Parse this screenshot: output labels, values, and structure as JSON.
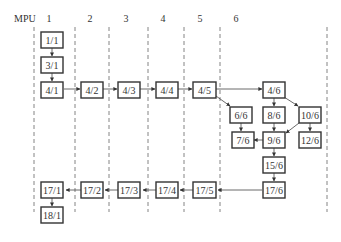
{
  "header": {
    "axis_label": "MPU",
    "columns": [
      "1",
      "2",
      "3",
      "4",
      "5",
      "6"
    ]
  },
  "nodes": {
    "n1_1": "1/1",
    "n3_1": "3/1",
    "n4_1": "4/1",
    "n4_2": "4/2",
    "n4_3": "4/3",
    "n4_4": "4/4",
    "n4_5": "4/5",
    "n4_6": "4/6",
    "n6_6": "6/6",
    "n8_6": "8/6",
    "n10_6": "10/6",
    "n7_6": "7/6",
    "n9_6": "9/6",
    "n12_6": "12/6",
    "n15_6": "15/6",
    "n17_6": "17/6",
    "n17_5": "17/5",
    "n17_4": "17/4",
    "n17_3": "17/3",
    "n17_2": "17/2",
    "n17_1": "17/1",
    "n18_1": "18/1"
  },
  "edges": [
    [
      "1/1",
      "3/1"
    ],
    [
      "3/1",
      "4/1"
    ],
    [
      "4/1",
      "4/2"
    ],
    [
      "4/2",
      "4/3"
    ],
    [
      "4/3",
      "4/4"
    ],
    [
      "4/4",
      "4/5"
    ],
    [
      "4/5",
      "4/6"
    ],
    [
      "4/5",
      "6/6"
    ],
    [
      "4/6",
      "8/6"
    ],
    [
      "4/6",
      "10/6"
    ],
    [
      "6/6",
      "7/6"
    ],
    [
      "8/6",
      "9/6"
    ],
    [
      "10/6",
      "9/6"
    ],
    [
      "10/6",
      "12/6"
    ],
    [
      "9/6",
      "7/6"
    ],
    [
      "9/6",
      "15/6"
    ],
    [
      "15/6",
      "17/6"
    ],
    [
      "17/6",
      "17/5"
    ],
    [
      "17/5",
      "17/4"
    ],
    [
      "17/4",
      "17/3"
    ],
    [
      "17/3",
      "17/2"
    ],
    [
      "17/2",
      "17/1"
    ],
    [
      "17/1",
      "18/1"
    ]
  ]
}
